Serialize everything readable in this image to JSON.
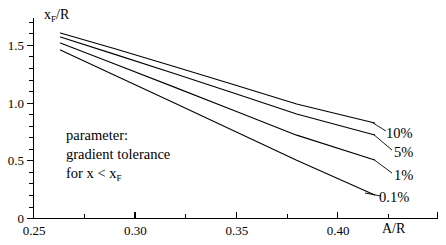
{
  "chart_data": {
    "type": "line",
    "title": "",
    "xlabel": "A/R",
    "ylabel": "x_F/R",
    "xlim": [
      0.25,
      0.4315
    ],
    "ylim": [
      0,
      1.72
    ],
    "grid": false,
    "legend_position": "right-inline-labels",
    "x_ticks": [
      0.25,
      0.3,
      0.35,
      0.4
    ],
    "x_ticklabels": [
      "0.25",
      "0.30",
      "0.35",
      "0.40"
    ],
    "x_minor_ticks": [
      0.26,
      0.27,
      0.28,
      0.29,
      0.31,
      0.32,
      0.33,
      0.34,
      0.36,
      0.37,
      0.38,
      0.39,
      0.41,
      0.42
    ],
    "y_ticks": [
      0,
      0.5,
      1.0,
      1.5
    ],
    "y_ticklabels": [
      "0",
      "0.5",
      "1.0",
      "1.5"
    ],
    "y_minor_ticks": [
      0.1,
      0.2,
      0.3,
      0.4,
      0.6,
      0.7,
      0.8,
      0.9,
      1.1,
      1.2,
      1.3,
      1.4,
      1.6,
      1.7
    ],
    "annotation": {
      "line1": "parameter:",
      "line2": "gradient tolerance",
      "line3_prefix": "for x < x",
      "line3_sub": "F"
    },
    "series": [
      {
        "name": "10%",
        "label": "10%",
        "color": "#000000",
        "x": [
          0.2635,
          0.29,
          0.32,
          0.35,
          0.38,
          0.4185
        ],
        "y": [
          1.603,
          1.468,
          1.311,
          1.15,
          0.988,
          0.823
        ]
      },
      {
        "name": "5%",
        "label": "5%",
        "color": "#000000",
        "x": [
          0.2635,
          0.29,
          0.32,
          0.35,
          0.38,
          0.4185
        ],
        "y": [
          1.568,
          1.42,
          1.25,
          1.076,
          0.901,
          0.719
        ]
      },
      {
        "name": "1%",
        "label": "1%",
        "color": "#000000",
        "x": [
          0.2635,
          0.29,
          0.32,
          0.35,
          0.38,
          0.4185
        ],
        "y": [
          1.516,
          1.337,
          1.132,
          0.926,
          0.718,
          0.503
        ]
      },
      {
        "name": "0.1%",
        "label": "0.1%",
        "color": "#000000",
        "x": [
          0.2635,
          0.29,
          0.32,
          0.35,
          0.38,
          0.4185
        ],
        "y": [
          1.455,
          1.24,
          0.995,
          0.748,
          0.5,
          0.2
        ]
      }
    ]
  },
  "axis_titles": {
    "y_main": "x",
    "y_sub": "F",
    "y_rest": "/R",
    "x": "A/R"
  }
}
